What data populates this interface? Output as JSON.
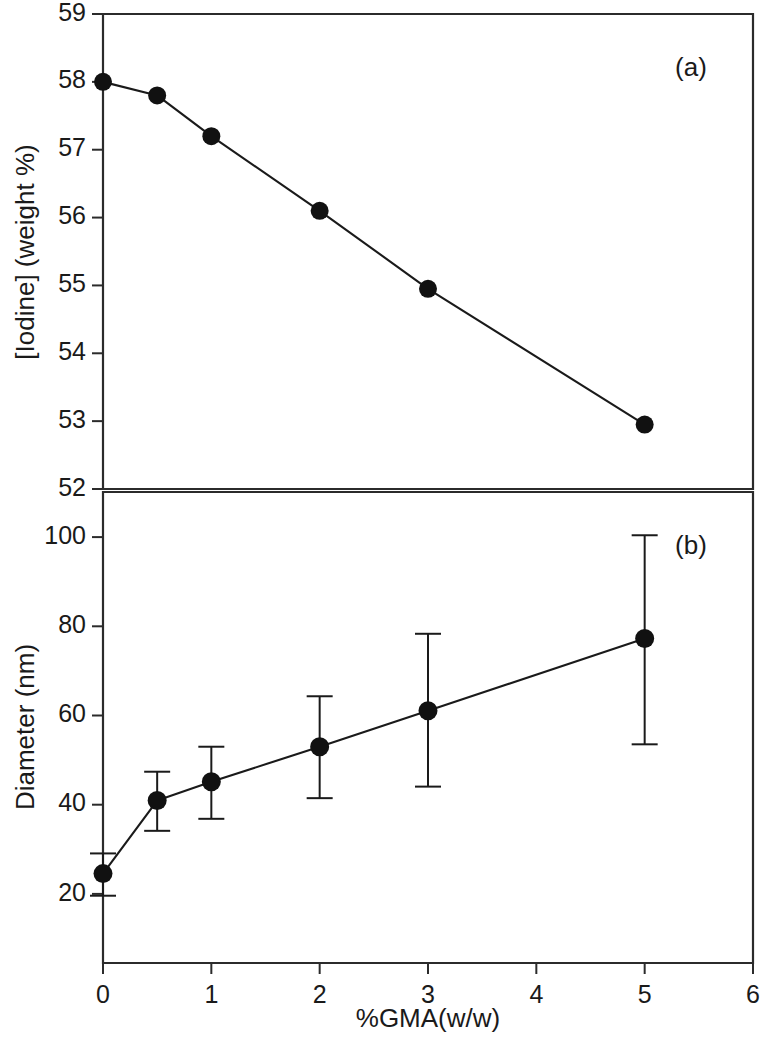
{
  "figure": {
    "background_color": "#ffffff",
    "ink_color": "#1a1a1a",
    "xlabel": "%GMA(w/w)",
    "x_ticks": [
      "0",
      "1",
      "2",
      "3",
      "4",
      "5",
      "6"
    ],
    "panel_a_tag": "(a)",
    "panel_b_tag": "(b)"
  },
  "chart_data": [
    {
      "type": "line",
      "panel": "(a)",
      "title": "",
      "xlabel": "%GMA(w/w)",
      "ylabel": "[Iodine] (weight %)",
      "xlim": [
        0,
        6
      ],
      "ylim": [
        52,
        59
      ],
      "xticks": [
        0,
        1,
        2,
        3,
        4,
        5,
        6
      ],
      "xticklabels": [
        "0",
        "1",
        "2",
        "3",
        "4",
        "5",
        "6"
      ],
      "yticks": [
        52,
        53,
        54,
        55,
        56,
        57,
        58,
        59
      ],
      "yticklabels": [
        "52",
        "53",
        "54",
        "55",
        "56",
        "57",
        "58",
        "59"
      ],
      "grid": false,
      "legend": null,
      "marker": "filled-circle",
      "x": [
        0,
        0.5,
        1,
        2,
        3,
        5
      ],
      "values": [
        58.0,
        57.8,
        57.2,
        56.1,
        54.95,
        52.95
      ]
    },
    {
      "type": "line",
      "panel": "(b)",
      "title": "",
      "xlabel": "%GMA(w/w)",
      "ylabel": "Diameter (nm)",
      "xlim": [
        0,
        6
      ],
      "ylim": [
        12,
        110
      ],
      "xticks": [
        0,
        1,
        2,
        3,
        4,
        5,
        6
      ],
      "xticklabels": [
        "0",
        "1",
        "2",
        "3",
        "4",
        "5",
        "6"
      ],
      "yticks": [
        20,
        40,
        60,
        80,
        100
      ],
      "yticklabels": [
        "20",
        "40",
        "60",
        "80",
        "100"
      ],
      "grid": false,
      "legend": null,
      "marker": "filled-circle",
      "errorbars": true,
      "x": [
        0,
        0.5,
        1,
        2,
        3,
        5
      ],
      "values": [
        30.6,
        45.8,
        49.7,
        57.0,
        64.5,
        79.5
      ],
      "err_low": [
        26.0,
        39.5,
        42.0,
        46.3,
        48.7,
        57.5
      ],
      "err_high": [
        34.8,
        51.8,
        57.0,
        67.5,
        80.5,
        101.0
      ]
    }
  ]
}
